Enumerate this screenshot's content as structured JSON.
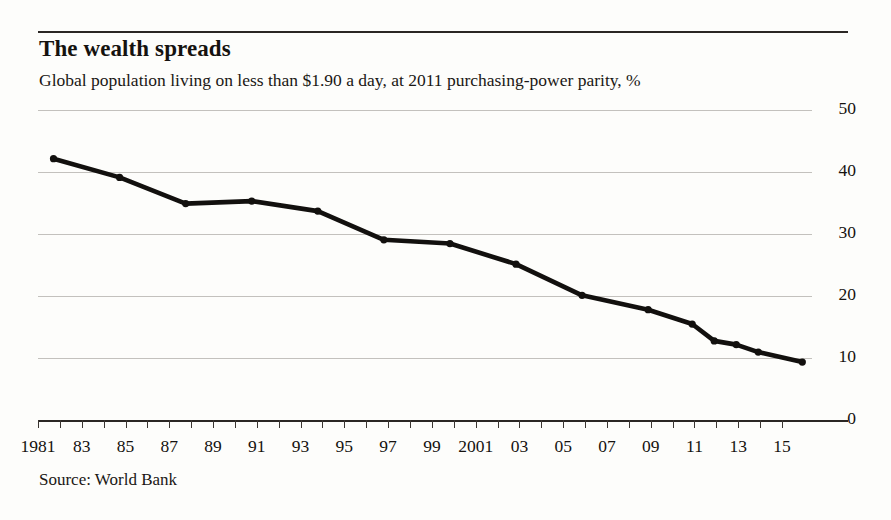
{
  "title": "The wealth spreads",
  "subtitle": "Global population living on less than $1.90 a day, at 2011 purchasing-power parity, %",
  "source": "Source: World Bank",
  "colors": {
    "line": "#12100e",
    "rule": "#2b2724",
    "grid": "#c3c1bd",
    "background": "#fdfdfb"
  },
  "chart_data": {
    "type": "line",
    "title": "The wealth spreads",
    "subtitle": "Global population living on less than $1.90 a day, at 2011 purchasing-power parity, %",
    "xlabel": "",
    "ylabel": "%",
    "ylim": [
      0,
      50
    ],
    "yticks": [
      0,
      10,
      20,
      30,
      40,
      50
    ],
    "ytick_labels": [
      "0",
      "10",
      "20",
      "30",
      "40",
      "50"
    ],
    "xlim": [
      1981,
      2015
    ],
    "xticks": [
      1981,
      1982,
      1983,
      1984,
      1985,
      1986,
      1987,
      1988,
      1989,
      1990,
      1991,
      1992,
      1993,
      1994,
      1995,
      1996,
      1997,
      1998,
      1999,
      2000,
      2001,
      2002,
      2003,
      2004,
      2005,
      2006,
      2007,
      2008,
      2009,
      2010,
      2011,
      2012,
      2013,
      2014,
      2015
    ],
    "xtick_labels": [
      "1981",
      "",
      "83",
      "",
      "85",
      "",
      "87",
      "",
      "89",
      "",
      "91",
      "",
      "93",
      "",
      "95",
      "",
      "97",
      "",
      "99",
      "",
      "2001",
      "",
      "03",
      "",
      "05",
      "",
      "07",
      "",
      "09",
      "",
      "11",
      "",
      "13",
      "",
      "15"
    ],
    "grid": true,
    "grid_axis": "y",
    "legend": false,
    "markers": true,
    "series": [
      {
        "name": "Share of global population below $1.90 a day",
        "x": [
          1981,
          1984,
          1987,
          1990,
          1993,
          1996,
          1999,
          2002,
          2005,
          2008,
          2010,
          2011,
          2012,
          2013,
          2015
        ],
        "values": [
          42.2,
          39.2,
          35.0,
          35.4,
          33.8,
          29.2,
          28.6,
          25.3,
          20.3,
          18.0,
          15.7,
          13.0,
          12.4,
          11.2,
          9.6
        ]
      }
    ],
    "source": "Source: World Bank"
  }
}
